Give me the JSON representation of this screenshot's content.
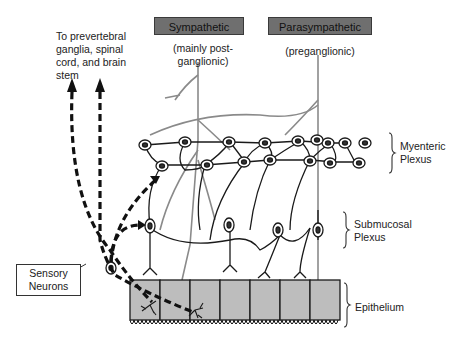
{
  "diagram": {
    "type": "anatomical-schematic",
    "headers": {
      "sympathetic": {
        "label": "Sympathetic",
        "sub": "(mainly post-\nganglionic)"
      },
      "parasympathetic": {
        "label": "Parasympathetic",
        "sub": "(preganglionic)"
      }
    },
    "top_left_label": "To prevertebral\nganglia, spinal\ncord, and brain\nstem",
    "layers": [
      {
        "id": "myenteric",
        "label": "Myenteric\nPlexus"
      },
      {
        "id": "submucosal",
        "label": "Submucosal\nPlexus"
      },
      {
        "id": "epithelium",
        "label": "Epithelium"
      }
    ],
    "callout": {
      "label": "Sensory\nNeurons"
    },
    "colors": {
      "header_fill": "#6f6f6f",
      "epithelium_fill": "#bdbdbd",
      "autonomic_fiber": "#8a8a8a",
      "neuron": "#1a1a1a"
    },
    "epithelial_cell_count": 7,
    "myenteric_neuron_count": 16,
    "submucosal_neuron_count": 5
  }
}
